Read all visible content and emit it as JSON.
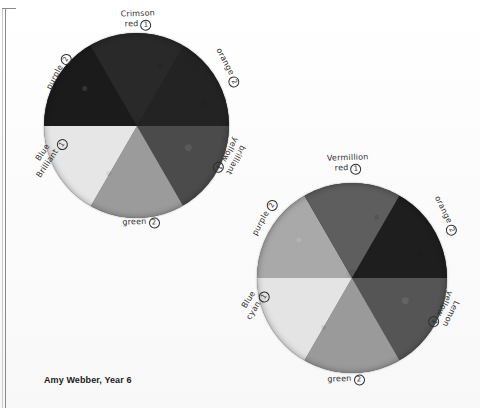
{
  "caption": "Amy Webber, Year 6",
  "wheels": [
    {
      "name": "wheel-left",
      "segments": [
        {
          "label_line1": "Crimson",
          "label_line2": "red",
          "number": "1",
          "color": "#4c4c4c"
        },
        {
          "label_line1": "orange",
          "label_line2": "",
          "number": "2",
          "color": "#9c9c9c"
        },
        {
          "label_line1": "brilliant",
          "label_line2": "yellow",
          "number": "1",
          "color": "#e6e6e6"
        },
        {
          "label_line1": "green",
          "label_line2": "",
          "number": "2",
          "color": "#1c1c1c"
        },
        {
          "label_line1": "Blue",
          "label_line2": "Brilliant",
          "number": "1",
          "color": "#2a2a2a"
        },
        {
          "label_line1": "purple",
          "label_line2": "",
          "number": "2",
          "color": "#242424"
        }
      ]
    },
    {
      "name": "wheel-right",
      "segments": [
        {
          "label_line1": "Vermillion",
          "label_line2": "red",
          "number": "1",
          "color": "#565656"
        },
        {
          "label_line1": "orange",
          "label_line2": "",
          "number": "2",
          "color": "#9a9a9a"
        },
        {
          "label_line1": "Lemon",
          "label_line2": "yellow",
          "number": "1",
          "color": "#e4e4e4"
        },
        {
          "label_line1": "green",
          "label_line2": "",
          "number": "2",
          "color": "#a9a9a9"
        },
        {
          "label_line1": "Blue",
          "label_line2": "cyan",
          "number": "1",
          "color": "#5e5e5e"
        },
        {
          "label_line1": "purple",
          "label_line2": "",
          "number": "2",
          "color": "#1e1e1e"
        }
      ]
    }
  ],
  "colors": {
    "paper": "#fdfdfd",
    "ink": "#2e2e2e",
    "rule": "#8a8a8a"
  }
}
